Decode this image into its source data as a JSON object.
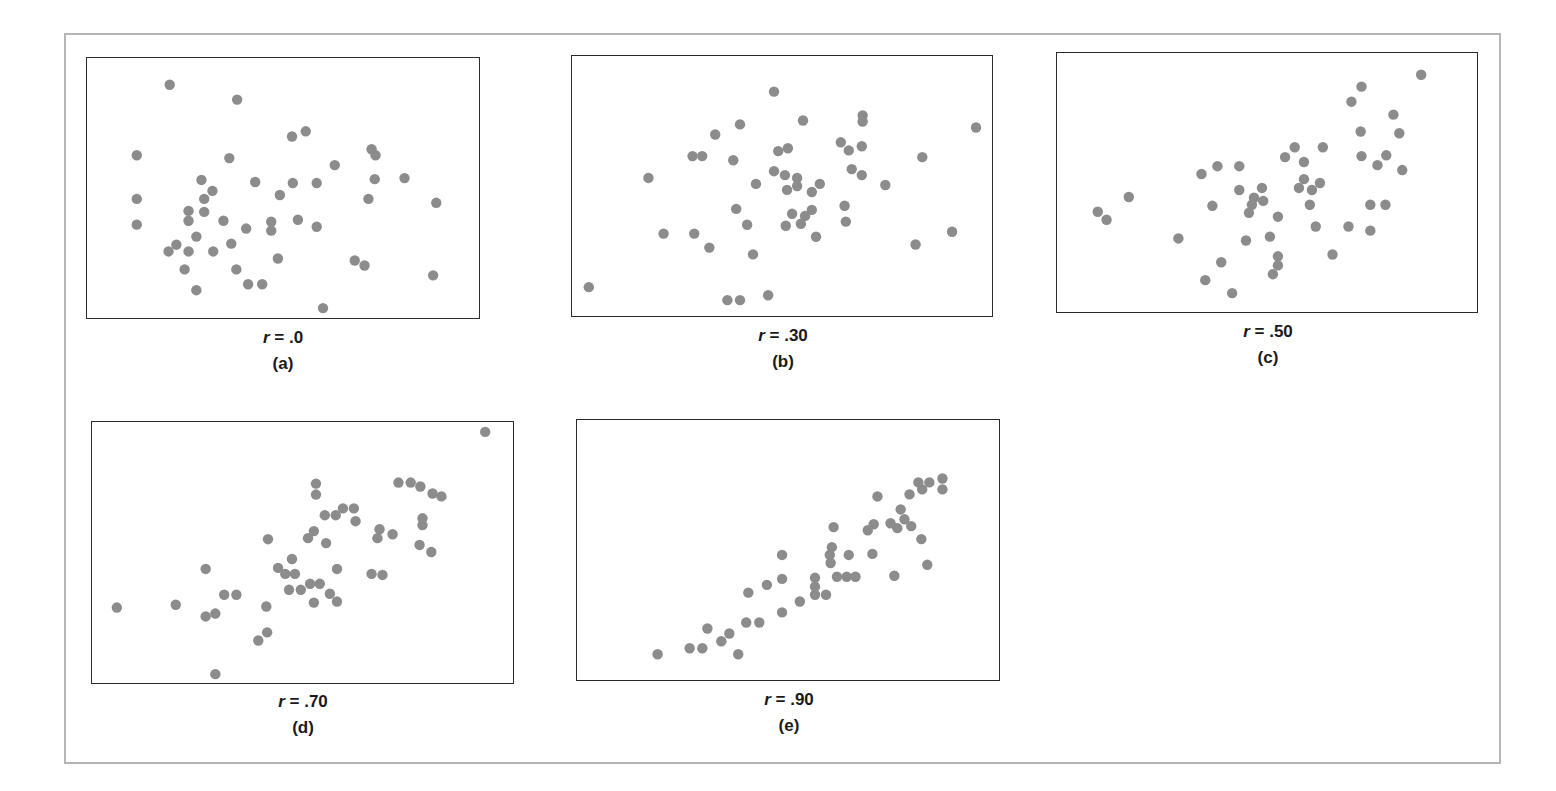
{
  "figure": {
    "dot_color": "#8c8c8c",
    "frame_color": "#b5b5b5",
    "box_color": "#2b2b2b",
    "panels": [
      {
        "id": "a",
        "r_var": "r",
        "r_eq": " = .0",
        "sub_label": "(a)"
      },
      {
        "id": "b",
        "r_var": "r",
        "r_eq": " = .30",
        "sub_label": "(b)"
      },
      {
        "id": "c",
        "r_var": "r",
        "r_eq": " = .50",
        "sub_label": "(c)"
      },
      {
        "id": "d",
        "r_var": "r",
        "r_eq": " = .70",
        "sub_label": "(d)"
      },
      {
        "id": "e",
        "r_var": "r",
        "r_eq": " = .90",
        "sub_label": "(e)"
      }
    ]
  },
  "chart_data": [
    {
      "type": "scatter",
      "title": "r = .0",
      "subtitle": "(a)",
      "xlabel": "",
      "ylabel": "",
      "xlim": [
        0,
        100
      ],
      "ylim": [
        0,
        100
      ],
      "grid": false,
      "axes_ticks": false,
      "points": [
        [
          21.1,
          89.7
        ],
        [
          38.3,
          84.0
        ],
        [
          52.3,
          69.8
        ],
        [
          55.8,
          71.8
        ],
        [
          12.7,
          62.6
        ],
        [
          36.3,
          61.5
        ],
        [
          72.6,
          64.9
        ],
        [
          73.6,
          62.6
        ],
        [
          63.2,
          58.8
        ],
        [
          29.2,
          53.1
        ],
        [
          42.9,
          52.3
        ],
        [
          52.5,
          51.9
        ],
        [
          58.6,
          51.9
        ],
        [
          73.4,
          53.4
        ],
        [
          81.0,
          53.8
        ],
        [
          12.7,
          45.8
        ],
        [
          32.0,
          48.9
        ],
        [
          29.9,
          45.8
        ],
        [
          49.2,
          47.3
        ],
        [
          71.8,
          45.8
        ],
        [
          89.1,
          44.3
        ],
        [
          25.9,
          41.2
        ],
        [
          29.9,
          40.8
        ],
        [
          12.7,
          35.9
        ],
        [
          25.9,
          37.4
        ],
        [
          34.8,
          37.4
        ],
        [
          47.0,
          37.0
        ],
        [
          53.8,
          37.8
        ],
        [
          40.6,
          34.4
        ],
        [
          47.0,
          33.6
        ],
        [
          58.6,
          35.1
        ],
        [
          27.9,
          31.3
        ],
        [
          22.8,
          28.2
        ],
        [
          20.8,
          25.6
        ],
        [
          25.9,
          25.6
        ],
        [
          32.2,
          25.6
        ],
        [
          36.8,
          28.6
        ],
        [
          48.7,
          22.9
        ],
        [
          68.3,
          22.1
        ],
        [
          70.8,
          20.2
        ],
        [
          24.9,
          18.7
        ],
        [
          38.1,
          18.7
        ],
        [
          88.3,
          16.4
        ],
        [
          41.1,
          13.0
        ],
        [
          44.7,
          13.0
        ],
        [
          27.9,
          10.7
        ],
        [
          60.2,
          3.8
        ]
      ]
    },
    {
      "type": "scatter",
      "title": "r = .30",
      "subtitle": "(b)",
      "xlabel": "",
      "ylabel": "",
      "xlim": [
        0,
        100
      ],
      "ylim": [
        0,
        100
      ],
      "grid": false,
      "axes_ticks": false,
      "points": [
        [
          48.1,
          86.3
        ],
        [
          55.0,
          75.2
        ],
        [
          69.2,
          77.1
        ],
        [
          69.2,
          74.8
        ],
        [
          96.2,
          72.5
        ],
        [
          40.0,
          73.7
        ],
        [
          34.1,
          69.8
        ],
        [
          64.0,
          66.8
        ],
        [
          65.9,
          63.7
        ],
        [
          69.0,
          65.3
        ],
        [
          49.1,
          63.4
        ],
        [
          51.4,
          64.5
        ],
        [
          28.7,
          61.5
        ],
        [
          31.0,
          61.5
        ],
        [
          38.4,
          59.9
        ],
        [
          83.4,
          61.1
        ],
        [
          18.2,
          53.1
        ],
        [
          48.1,
          55.7
        ],
        [
          50.7,
          54.2
        ],
        [
          53.6,
          53.1
        ],
        [
          66.6,
          56.5
        ],
        [
          69.0,
          54.2
        ],
        [
          43.8,
          50.8
        ],
        [
          53.6,
          50.0
        ],
        [
          59.0,
          50.8
        ],
        [
          51.2,
          48.5
        ],
        [
          57.1,
          47.7
        ],
        [
          74.6,
          50.4
        ],
        [
          39.1,
          41.2
        ],
        [
          64.9,
          42.4
        ],
        [
          57.1,
          40.8
        ],
        [
          52.4,
          39.3
        ],
        [
          55.5,
          38.5
        ],
        [
          41.7,
          35.1
        ],
        [
          50.9,
          34.7
        ],
        [
          54.5,
          35.5
        ],
        [
          65.2,
          36.3
        ],
        [
          21.8,
          31.7
        ],
        [
          29.1,
          31.7
        ],
        [
          58.1,
          30.5
        ],
        [
          90.5,
          32.4
        ],
        [
          32.7,
          26.3
        ],
        [
          81.8,
          27.5
        ],
        [
          43.1,
          23.7
        ],
        [
          4.0,
          11.1
        ],
        [
          46.7,
          8.0
        ],
        [
          37.0,
          6.1
        ],
        [
          40.0,
          6.1
        ]
      ]
    },
    {
      "type": "scatter",
      "title": "r = .50",
      "subtitle": "(c)",
      "xlabel": "",
      "ylabel": "",
      "xlim": [
        0,
        100
      ],
      "ylim": [
        0,
        100
      ],
      "grid": false,
      "axes_ticks": false,
      "points": [
        [
          86.7,
          91.6
        ],
        [
          72.5,
          87.0
        ],
        [
          70.1,
          81.2
        ],
        [
          80.1,
          76.2
        ],
        [
          72.3,
          69.7
        ],
        [
          81.5,
          69.0
        ],
        [
          56.6,
          63.6
        ],
        [
          63.3,
          63.6
        ],
        [
          54.3,
          59.8
        ],
        [
          58.8,
          57.9
        ],
        [
          72.5,
          60.2
        ],
        [
          78.4,
          60.5
        ],
        [
          76.3,
          56.7
        ],
        [
          82.2,
          54.8
        ],
        [
          34.4,
          53.3
        ],
        [
          38.2,
          56.3
        ],
        [
          43.4,
          56.3
        ],
        [
          58.8,
          51.3
        ],
        [
          62.6,
          49.8
        ],
        [
          57.6,
          47.9
        ],
        [
          60.7,
          47.1
        ],
        [
          48.8,
          47.9
        ],
        [
          43.4,
          47.1
        ],
        [
          46.9,
          44.1
        ],
        [
          49.1,
          42.9
        ],
        [
          46.4,
          41.4
        ],
        [
          45.7,
          38.3
        ],
        [
          17.1,
          44.4
        ],
        [
          37.0,
          41.0
        ],
        [
          60.2,
          41.4
        ],
        [
          74.6,
          41.4
        ],
        [
          78.2,
          41.4
        ],
        [
          9.7,
          38.7
        ],
        [
          11.8,
          35.6
        ],
        [
          52.6,
          36.8
        ],
        [
          61.6,
          33.0
        ],
        [
          69.4,
          33.0
        ],
        [
          74.6,
          31.4
        ],
        [
          28.9,
          28.4
        ],
        [
          45.0,
          27.6
        ],
        [
          50.7,
          29.1
        ],
        [
          52.6,
          21.5
        ],
        [
          52.6,
          18.0
        ],
        [
          51.4,
          14.6
        ],
        [
          65.6,
          22.2
        ],
        [
          39.1,
          19.2
        ],
        [
          35.3,
          12.3
        ],
        [
          41.7,
          7.3
        ]
      ]
    },
    {
      "type": "scatter",
      "title": "r = .70",
      "subtitle": "(d)",
      "xlabel": "",
      "ylabel": "",
      "xlim": [
        0,
        100
      ],
      "ylim": [
        0,
        100
      ],
      "grid": false,
      "axes_ticks": false,
      "points": [
        [
          93.4,
          96.2
        ],
        [
          53.2,
          76.4
        ],
        [
          53.2,
          72.2
        ],
        [
          72.8,
          76.8
        ],
        [
          75.7,
          76.8
        ],
        [
          78.0,
          75.3
        ],
        [
          80.9,
          72.6
        ],
        [
          83.0,
          71.5
        ],
        [
          55.3,
          64.3
        ],
        [
          57.9,
          64.3
        ],
        [
          59.6,
          66.9
        ],
        [
          62.2,
          66.9
        ],
        [
          62.6,
          62.0
        ],
        [
          78.5,
          63.1
        ],
        [
          78.5,
          60.5
        ],
        [
          51.3,
          55.5
        ],
        [
          52.7,
          58.2
        ],
        [
          55.6,
          53.6
        ],
        [
          68.3,
          58.9
        ],
        [
          67.8,
          55.5
        ],
        [
          71.4,
          57.0
        ],
        [
          77.8,
          52.9
        ],
        [
          80.6,
          50.2
        ],
        [
          41.8,
          55.1
        ],
        [
          47.5,
          47.5
        ],
        [
          44.2,
          44.1
        ],
        [
          45.9,
          41.8
        ],
        [
          48.2,
          41.8
        ],
        [
          58.2,
          43.7
        ],
        [
          66.4,
          41.8
        ],
        [
          69.0,
          41.4
        ],
        [
          27.0,
          43.7
        ],
        [
          46.8,
          35.7
        ],
        [
          49.6,
          35.7
        ],
        [
          51.8,
          38.0
        ],
        [
          54.1,
          38.0
        ],
        [
          56.5,
          34.2
        ],
        [
          52.7,
          30.8
        ],
        [
          58.2,
          31.2
        ],
        [
          31.4,
          33.8
        ],
        [
          34.3,
          33.8
        ],
        [
          5.9,
          28.9
        ],
        [
          19.9,
          30.0
        ],
        [
          27.0,
          25.5
        ],
        [
          29.3,
          26.6
        ],
        [
          41.4,
          29.3
        ],
        [
          41.6,
          19.4
        ],
        [
          39.5,
          16.3
        ],
        [
          29.3,
          3.4
        ]
      ]
    },
    {
      "type": "scatter",
      "title": "r = .90",
      "subtitle": "(e)",
      "xlabel": "",
      "ylabel": "",
      "xlim": [
        0,
        100
      ],
      "ylim": [
        0,
        100
      ],
      "grid": false,
      "axes_ticks": false,
      "points": [
        [
          86.6,
          77.5
        ],
        [
          86.6,
          73.3
        ],
        [
          80.9,
          76.0
        ],
        [
          83.5,
          76.0
        ],
        [
          81.8,
          73.3
        ],
        [
          78.8,
          71.4
        ],
        [
          71.2,
          70.6
        ],
        [
          76.7,
          65.6
        ],
        [
          77.6,
          61.8
        ],
        [
          74.3,
          60.3
        ],
        [
          75.9,
          58.4
        ],
        [
          79.2,
          59.2
        ],
        [
          70.3,
          59.9
        ],
        [
          68.9,
          57.6
        ],
        [
          81.6,
          54.2
        ],
        [
          60.8,
          58.8
        ],
        [
          60.4,
          51.1
        ],
        [
          59.9,
          48.1
        ],
        [
          60.1,
          45.0
        ],
        [
          64.4,
          48.1
        ],
        [
          70.0,
          48.5
        ],
        [
          83.0,
          44.3
        ],
        [
          75.2,
          40.1
        ],
        [
          61.6,
          39.7
        ],
        [
          63.9,
          39.7
        ],
        [
          66.0,
          39.7
        ],
        [
          48.6,
          48.1
        ],
        [
          56.4,
          39.3
        ],
        [
          56.4,
          35.9
        ],
        [
          56.4,
          32.8
        ],
        [
          59.0,
          32.8
        ],
        [
          52.8,
          30.2
        ],
        [
          48.6,
          38.9
        ],
        [
          45.0,
          36.6
        ],
        [
          40.6,
          33.6
        ],
        [
          48.6,
          26.0
        ],
        [
          40.1,
          22.1
        ],
        [
          43.2,
          22.1
        ],
        [
          30.9,
          19.8
        ],
        [
          36.1,
          17.9
        ],
        [
          34.2,
          14.9
        ],
        [
          26.7,
          12.2
        ],
        [
          29.7,
          12.2
        ],
        [
          19.1,
          9.9
        ],
        [
          38.2,
          9.9
        ]
      ]
    }
  ]
}
